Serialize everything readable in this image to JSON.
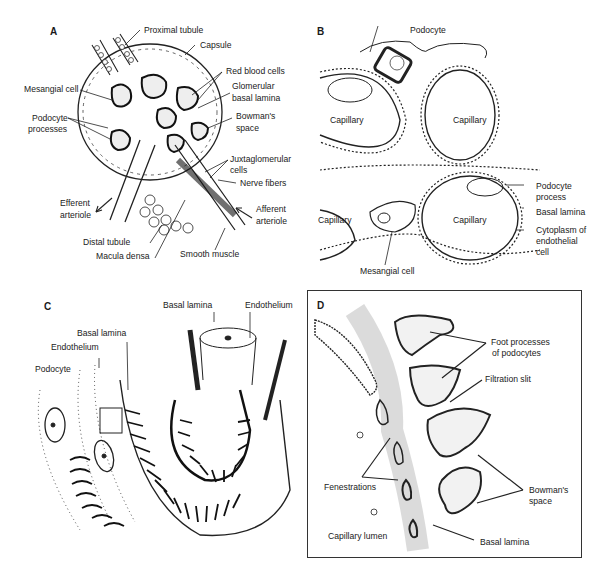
{
  "figure": {
    "panels": [
      {
        "id": "A",
        "labels": [
          "Proximal tubule",
          "Capsule",
          "Red blood cells",
          "Glomerular",
          "basal lamina",
          "Mesangial cell",
          "Podocyte",
          "processes",
          "Bowman's",
          "space",
          "Juxtaglomerular",
          "cells",
          "Nerve fibers",
          "Efferent",
          "arteriole",
          "Afferent",
          "arteriole",
          "Distal tubule",
          "Macula densa",
          "Smooth muscle"
        ]
      },
      {
        "id": "B",
        "labels": [
          "Podocyte",
          "Capillary",
          "Capillary",
          "Capillary",
          "Capillary",
          "Podocyte",
          "process",
          "Basal lamina",
          "Cytoplasm of",
          "endothelial",
          "cell",
          "Mesangial cell"
        ]
      },
      {
        "id": "C",
        "labels": [
          "Basal lamina",
          "Endothelium",
          "Basal lamina",
          "Endothelium",
          "Podocyte"
        ]
      },
      {
        "id": "D",
        "labels": [
          "Foot processes",
          "of podocytes",
          "Filtration slit",
          "Fenestrations",
          "Bowman's",
          "space",
          "Capillary lumen",
          "Basal lamina"
        ]
      }
    ]
  },
  "colors": {
    "ink": "#1a1a1a",
    "background": "#ffffff",
    "frame": "#333333"
  }
}
